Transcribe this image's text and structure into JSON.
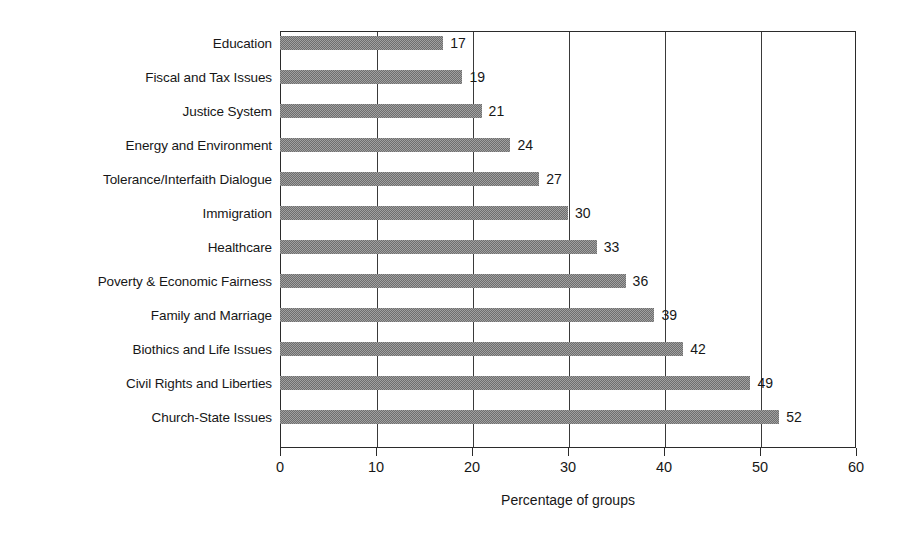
{
  "chart_data": {
    "type": "bar",
    "orientation": "horizontal",
    "title": "",
    "xlabel": "Percentage of groups",
    "ylabel": "",
    "xlim": [
      0,
      60
    ],
    "xticks": [
      0,
      10,
      20,
      30,
      40,
      50,
      60
    ],
    "grid": "vertical",
    "legend": "none",
    "bar_color": "#999999",
    "categories": [
      "Education",
      "Fiscal and Tax Issues",
      "Justice System",
      "Energy and Environment",
      "Tolerance/Interfaith Dialogue",
      "Immigration",
      "Healthcare",
      "Poverty & Economic Fairness",
      "Family and Marriage",
      "Biothics and Life Issues",
      "Civil Rights and Liberties",
      "Church-State Issues"
    ],
    "values": [
      17,
      19,
      21,
      24,
      27,
      30,
      33,
      36,
      39,
      42,
      49,
      52
    ],
    "data_labels": [
      "17",
      "19",
      "21",
      "24",
      "27",
      "30",
      "33",
      "36",
      "39",
      "42",
      "49",
      "52"
    ],
    "tick_labels": [
      "0",
      "10",
      "20",
      "30",
      "40",
      "50",
      "60"
    ]
  }
}
